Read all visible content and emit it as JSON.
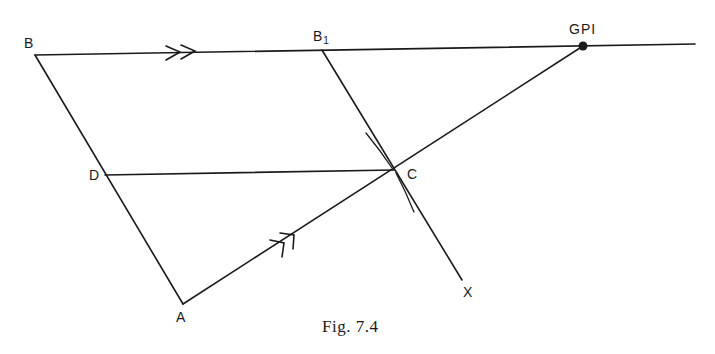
{
  "figure": {
    "caption": "Fig. 7.4",
    "points": {
      "B": "B",
      "B1_main": "B",
      "B1_sub": "1",
      "GPI": "GPI",
      "D": "D",
      "C": "C",
      "A": "A",
      "X": "X"
    },
    "lines": [
      {
        "name": "line-B-GPI",
        "from": "B",
        "to": "beyond GPI",
        "marker": "double-arrow"
      },
      {
        "name": "line-B-A",
        "from": "B",
        "to": "A"
      },
      {
        "name": "line-A-GPI",
        "from": "A",
        "to": "GPI",
        "marker": "double-arrow"
      },
      {
        "name": "line-D-C",
        "from": "D",
        "to": "C"
      },
      {
        "name": "line-B1-X",
        "from": "B1",
        "to": "X"
      }
    ],
    "colors": {
      "ink": "#1a1a1a",
      "background": "#ffffff"
    }
  }
}
